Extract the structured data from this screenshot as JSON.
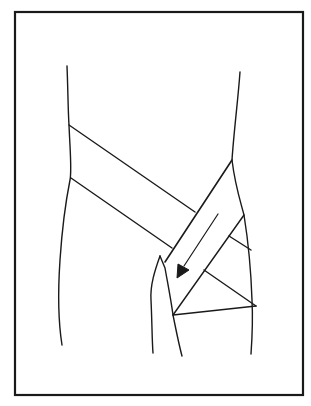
{
  "figure": {
    "frame_color": "#1a1a1a",
    "stroke_color": "#1a1a1a",
    "background": "#ffffff",
    "elements": [
      "frame",
      "torso-outline",
      "hip-outline",
      "bandage-band-horizontal",
      "bandage-band-diagonal",
      "direction-arrow",
      "bandage-wrap-triangles"
    ]
  }
}
